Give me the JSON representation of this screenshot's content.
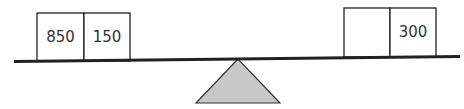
{
  "diagram": {
    "type": "balance-scale",
    "left_boxes": [
      {
        "label": "850"
      },
      {
        "label": "150"
      }
    ],
    "right_boxes": [
      {
        "label": ""
      },
      {
        "label": "300"
      }
    ],
    "colors": {
      "beam": "#222222",
      "fulcrum_fill": "#c8c8c8",
      "fulcrum_stroke": "#333333",
      "box_stroke": "#222222"
    }
  }
}
